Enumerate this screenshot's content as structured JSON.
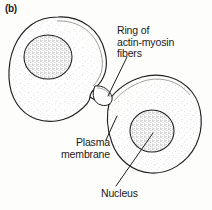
{
  "figure": {
    "panel_letter": "(b)",
    "background_color": "#fdfdfc",
    "ink_color": "#1a1a1a",
    "stipple_color": "#4a4a4a"
  },
  "labels": {
    "ring": "Ring of\nactin-myosin\nfibers",
    "ring_lines": [
      "Ring of",
      "actin-myosin",
      "fibers"
    ],
    "membrane": "Plasma\nmembrane",
    "membrane_lines": [
      "Plasma",
      "membrane"
    ],
    "nucleus": "Nucleus"
  },
  "structures": {
    "left_cell": "daughter-cell-left",
    "right_cell": "daughter-cell-right",
    "left_nucleus": "nucleus-left",
    "right_nucleus": "nucleus-right",
    "contractile_ring": "actin-myosin-contractile-ring",
    "furrow": "cleavage-furrow"
  }
}
